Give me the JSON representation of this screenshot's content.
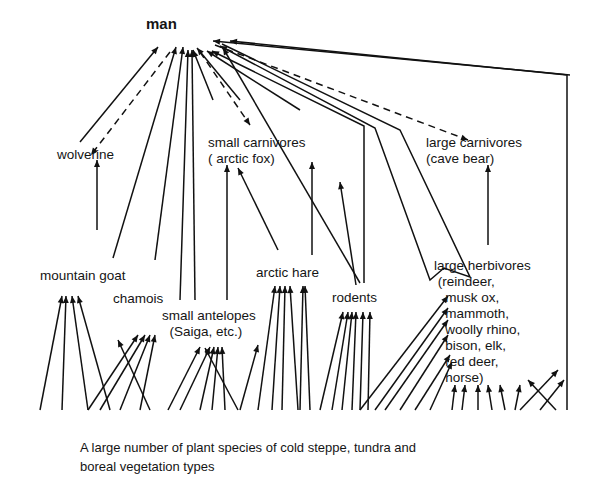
{
  "diagram": {
    "nodes": [
      {
        "id": "man",
        "label": "man",
        "x": 146,
        "y": 16,
        "bold": true
      },
      {
        "id": "wolverine",
        "label": "wolverine",
        "x": 57,
        "y": 147
      },
      {
        "id": "small_carnivores",
        "label": "small carnivores\n( arctic fox)",
        "x": 208,
        "y": 135
      },
      {
        "id": "large_carnivores",
        "label": "large carnivores\n(cave bear)",
        "x": 426,
        "y": 135
      },
      {
        "id": "mountain_goat",
        "label": "mountain goat",
        "x": 40,
        "y": 268
      },
      {
        "id": "chamois",
        "label": "chamois",
        "x": 113,
        "y": 291
      },
      {
        "id": "small_antelopes",
        "label": "small antelopes\n  (Saiga, etc.)",
        "x": 162,
        "y": 308
      },
      {
        "id": "arctic_hare",
        "label": "arctic hare",
        "x": 256,
        "y": 265
      },
      {
        "id": "rodents",
        "label": "rodents",
        "x": 332,
        "y": 290
      },
      {
        "id": "large_herbivores",
        "label": "large herbivores\n (reindeer,\n   musk ox,\n   mammoth,\n   woolly rhino,\n   bison, elk,\n   red deer,\n   horse)",
        "x": 434,
        "y": 258
      }
    ],
    "caption": {
      "line1": "A large number of plant species of cold steppe, tundra and",
      "line2": "boreal vegetation types"
    },
    "legend": {
      "solid_arrow": "feeds on (energy flow)",
      "dashed_arrow": "competition / predation on man"
    },
    "edges_solid": [
      [
        80,
        142,
        158,
        47
      ],
      [
        176,
        47,
        113,
        258
      ],
      [
        183,
        47,
        155,
        260
      ],
      [
        188,
        50,
        180,
        300
      ],
      [
        192,
        50,
        195,
        300
      ],
      [
        193,
        50,
        213,
        100
      ],
      [
        197,
        48,
        240,
        100
      ],
      [
        223,
        48,
        360,
        283
      ],
      [
        97,
        230,
        97,
        160
      ],
      [
        227,
        300,
        227,
        165
      ],
      [
        278,
        250,
        238,
        168
      ],
      [
        312,
        255,
        312,
        162
      ],
      [
        340,
        182,
        356,
        285
      ],
      [
        488,
        245,
        488,
        165
      ],
      [
        207,
        51,
        300,
        110
      ],
      [
        213,
        41,
        570,
        75
      ]
    ],
    "edges_dashed": [
      [
        170,
        52,
        91,
        155
      ],
      [
        200,
        52,
        250,
        125
      ],
      [
        215,
        45,
        468,
        140
      ]
    ],
    "special_paths": [
      {
        "name": "path-man-large-herbivores-1",
        "points": "212,51 364,126 364,283"
      },
      {
        "name": "path-man-rodents-to-herbivores",
        "points": "220,46 375,128 430,280 444,268 470,277 400,130 222,44"
      },
      {
        "name": "path-man-right-border",
        "points": "230,41 567,75 567,410"
      }
    ],
    "plant_base_y": 410
  }
}
